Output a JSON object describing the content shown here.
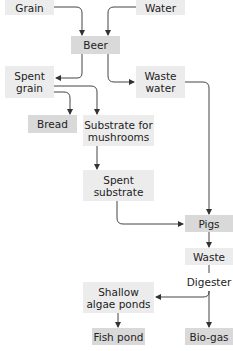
{
  "diagram": {
    "type": "flowchart",
    "colors": {
      "light_box": "#ececec",
      "dark_box": "#d9d9d9",
      "line": "#333333"
    },
    "nodes": {
      "grain": "Grain",
      "water": "Water",
      "beer": "Beer",
      "spent_grain": "Spent grain",
      "waste_water": "Waste water",
      "bread": "Bread",
      "substrate": "Substrate for mushrooms",
      "spent_substrate": "Spent substrate",
      "pigs": "Pigs",
      "waste": "Waste",
      "digester": "Digester",
      "algae_ponds": "Shallow algae ponds",
      "fish_pond": "Fish pond",
      "biogas": "Bio-gas"
    },
    "edges": [
      [
        "grain",
        "beer"
      ],
      [
        "water",
        "beer"
      ],
      [
        "beer",
        "spent_grain"
      ],
      [
        "beer",
        "waste_water"
      ],
      [
        "spent_grain",
        "bread"
      ],
      [
        "spent_grain",
        "substrate"
      ],
      [
        "substrate",
        "spent_substrate"
      ],
      [
        "spent_substrate",
        "pigs"
      ],
      [
        "waste_water",
        "pigs"
      ],
      [
        "pigs",
        "waste"
      ],
      [
        "waste",
        "digester"
      ],
      [
        "digester",
        "algae_ponds"
      ],
      [
        "digester",
        "biogas"
      ],
      [
        "algae_ponds",
        "fish_pond"
      ]
    ]
  }
}
